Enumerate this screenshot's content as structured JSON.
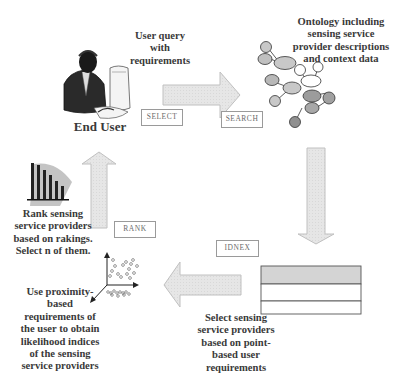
{
  "diagram": {
    "type": "process-flow",
    "nodes": {
      "end_user": {
        "label": "End User",
        "icon": "person-at-computer-icon"
      },
      "user_query": {
        "label_lines": [
          "User query",
          "with",
          "requirements"
        ]
      },
      "ontology": {
        "label_lines": [
          "Ontology including",
          "sensing service",
          "provider descriptions",
          "and context data"
        ],
        "icon": "ontology-graph-icon"
      },
      "point_select": {
        "label_lines": [
          "Select sensing",
          "service providers",
          "based on point-",
          "based user",
          "requirements"
        ],
        "icon": "table-list-icon"
      },
      "proximity": {
        "label_lines": [
          "Use proximity-",
          "based",
          "requirements of",
          "the user to obtain",
          "likelihood indices",
          "of the sensing",
          "service providers"
        ],
        "icon": "scatter-3d-icon"
      },
      "rank": {
        "label_lines": [
          "Rank sensing",
          "service providers",
          "based on rakings.",
          "Select n of them."
        ],
        "icon": "bar-chart-icon"
      }
    },
    "stages": {
      "select": "SELECT",
      "search": "SEARCH",
      "idnex": "IDNEX",
      "rank": "RANK"
    },
    "arrows": [
      {
        "from": "end_user",
        "to": "ontology",
        "direction": "right",
        "stage": "SELECT/SEARCH"
      },
      {
        "from": "ontology",
        "to": "point_select",
        "direction": "down",
        "stage": "IDNEX"
      },
      {
        "from": "point_select",
        "to": "proximity",
        "direction": "left"
      },
      {
        "from": "rank",
        "to": "end_user",
        "direction": "up",
        "stage": "RANK"
      }
    ],
    "colors": {
      "arrow_fill": "#e4e4e4",
      "arrow_stroke": "#b8b8b8",
      "text": "#3a3a3a",
      "node_light": "#c8c8c8",
      "node_mid": "#a8a8a8",
      "node_dark": "#8a8a8a"
    }
  }
}
